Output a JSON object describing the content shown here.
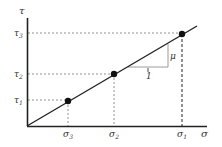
{
  "diagram": {
    "type": "linear stress diagram",
    "colors": {
      "axis": "#222222",
      "line": "#222222",
      "guide": "#666666",
      "triangle": "#999999",
      "point": "#111111",
      "label": "#333333"
    },
    "axes": {
      "x_label": "σ",
      "y_label": "τ"
    },
    "points": [
      {
        "x_label": "σ3",
        "y_label": "τ1",
        "x_main": "σ",
        "x_sub": "3",
        "y_main": "τ",
        "y_sub": "1"
      },
      {
        "x_label": "σ2",
        "y_label": "τ2",
        "x_main": "σ",
        "x_sub": "2",
        "y_main": "τ",
        "y_sub": "2"
      },
      {
        "x_label": "σ1",
        "y_label": "τ3",
        "x_main": "σ",
        "x_sub": "1",
        "y_main": "τ",
        "y_sub": "3"
      }
    ],
    "slope_triangle": {
      "run_label": "1",
      "rise_label": "μ"
    }
  }
}
